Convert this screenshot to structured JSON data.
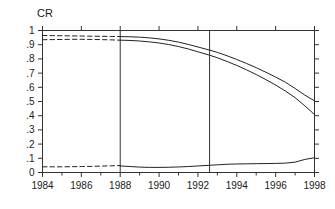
{
  "chart_data": {
    "type": "line",
    "title": "CR",
    "xlabel": "",
    "ylabel": "CR",
    "xlim": [
      1984,
      1998
    ],
    "ylim": [
      0,
      1
    ],
    "grid": false,
    "legend": null,
    "xticks": [
      1984,
      1986,
      1988,
      1990,
      1992,
      1994,
      1996,
      1998
    ],
    "xtick_labels": [
      "1984",
      "1986",
      "1988",
      "1990",
      "1992",
      "1994",
      "1996",
      "1998"
    ],
    "xminor_ticks": [
      1985,
      1987,
      1989,
      1991,
      1993,
      1995,
      1997
    ],
    "yticks": [
      0,
      0.1,
      0.2,
      0.3,
      0.4,
      0.5,
      0.6,
      0.7,
      0.8,
      0.9,
      1
    ],
    "ytick_labels": [
      "0",
      ".1",
      ".2",
      ".3",
      ".4",
      ".5",
      ".6",
      ".7",
      ".8",
      ".9",
      "1"
    ],
    "vertical_reference_lines": [
      1988,
      1992.6
    ],
    "series": [
      {
        "name": "upper-band-dashed",
        "style": "dashed",
        "x": [
          1984.0,
          1984.5,
          1985.0,
          1985.5,
          1986.0,
          1986.5,
          1987.0,
          1987.5,
          1988.0
        ],
        "values": [
          0.965,
          0.964,
          0.963,
          0.962,
          0.961,
          0.96,
          0.959,
          0.958,
          0.957
        ]
      },
      {
        "name": "lower-band-dashed",
        "style": "dashed",
        "x": [
          1984.0,
          1984.5,
          1985.0,
          1985.5,
          1986.0,
          1986.5,
          1987.0,
          1987.5,
          1988.0
        ],
        "values": [
          0.935,
          0.936,
          0.937,
          0.938,
          0.938,
          0.937,
          0.936,
          0.934,
          0.932
        ]
      },
      {
        "name": "upper-band-solid",
        "style": "solid",
        "x": [
          1988.0,
          1988.5,
          1989.0,
          1989.5,
          1990.0,
          1990.5,
          1991.0,
          1991.5,
          1992.0,
          1992.6,
          1993.0,
          1993.5,
          1994.0,
          1994.5,
          1995.0,
          1995.5,
          1996.0,
          1996.5,
          1997.0,
          1997.5,
          1998.0
        ],
        "values": [
          0.957,
          0.956,
          0.953,
          0.948,
          0.941,
          0.931,
          0.918,
          0.902,
          0.884,
          0.862,
          0.846,
          0.822,
          0.796,
          0.768,
          0.738,
          0.706,
          0.672,
          0.636,
          0.592,
          0.545,
          0.505
        ]
      },
      {
        "name": "lower-band-solid",
        "style": "solid",
        "x": [
          1988.0,
          1988.5,
          1989.0,
          1989.5,
          1990.0,
          1990.5,
          1991.0,
          1991.5,
          1992.0,
          1992.6,
          1993.0,
          1993.5,
          1994.0,
          1994.5,
          1995.0,
          1995.5,
          1996.0,
          1996.5,
          1997.0,
          1997.5,
          1998.0
        ],
        "values": [
          0.932,
          0.93,
          0.926,
          0.92,
          0.912,
          0.901,
          0.887,
          0.87,
          0.85,
          0.826,
          0.808,
          0.782,
          0.754,
          0.723,
          0.69,
          0.654,
          0.616,
          0.574,
          0.527,
          0.47,
          0.408
        ]
      },
      {
        "name": "baseline-dashed",
        "style": "dashed",
        "x": [
          1984.0,
          1984.5,
          1985.0,
          1985.5,
          1986.0,
          1986.5,
          1987.0,
          1987.5,
          1988.0
        ],
        "values": [
          0.04,
          0.04,
          0.04,
          0.041,
          0.042,
          0.043,
          0.045,
          0.047,
          0.049
        ]
      },
      {
        "name": "baseline-solid",
        "style": "solid",
        "x": [
          1988.0,
          1988.5,
          1989.0,
          1989.5,
          1990.0,
          1990.5,
          1991.0,
          1991.5,
          1992.0,
          1992.6,
          1993.0,
          1993.5,
          1994.0,
          1994.5,
          1995.0,
          1995.5,
          1996.0,
          1996.5,
          1997.0,
          1997.5,
          1998.0
        ],
        "values": [
          0.046,
          0.042,
          0.038,
          0.036,
          0.036,
          0.037,
          0.039,
          0.042,
          0.046,
          0.051,
          0.054,
          0.058,
          0.06,
          0.061,
          0.062,
          0.063,
          0.064,
          0.066,
          0.073,
          0.092,
          0.104
        ]
      }
    ]
  }
}
